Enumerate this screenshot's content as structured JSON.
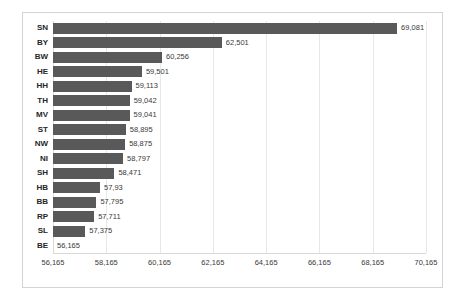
{
  "chart_data": {
    "type": "bar",
    "orientation": "horizontal",
    "title": "",
    "subtitle": "",
    "xlabel": "",
    "ylabel": "",
    "grid": true,
    "legend": false,
    "legend_position": "none",
    "bar_color": "#595959",
    "gridline_color": "#e8e8e8",
    "plot_border_color": "#d4d4d4",
    "xlim": [
      56165,
      70165
    ],
    "xticks": [
      "56,165",
      "58,165",
      "60,165",
      "62,165",
      "64,165",
      "66,165",
      "68,165",
      "70,165"
    ],
    "xtick_values": [
      56165,
      58165,
      60165,
      62165,
      64165,
      66165,
      68165,
      70165
    ],
    "categories": [
      "SN",
      "BY",
      "BW",
      "HE",
      "HH",
      "TH",
      "MV",
      "ST",
      "NW",
      "NI",
      "SH",
      "HB",
      "BB",
      "RP",
      "SL",
      "BE"
    ],
    "values": [
      69081,
      62501,
      60256,
      59501,
      59113,
      59042,
      59041,
      58895,
      58875,
      58797,
      58471,
      57930,
      57795,
      57711,
      57375,
      56165
    ],
    "data_labels": [
      "69,081",
      "62,501",
      "60,256",
      "59,501",
      "59,113",
      "59,042",
      "59,041",
      "58,895",
      "58,875",
      "58,797",
      "58,471",
      "57,93",
      "57,795",
      "57,711",
      "57,375",
      "56,165"
    ],
    "bars": [
      {
        "category": "SN",
        "value": 69081,
        "label": "69,081"
      },
      {
        "category": "BY",
        "value": 62501,
        "label": "62,501"
      },
      {
        "category": "BW",
        "value": 60256,
        "label": "60,256"
      },
      {
        "category": "HE",
        "value": 59501,
        "label": "59,501"
      },
      {
        "category": "HH",
        "value": 59113,
        "label": "59,113"
      },
      {
        "category": "TH",
        "value": 59042,
        "label": "59,042"
      },
      {
        "category": "MV",
        "value": 59041,
        "label": "59,041"
      },
      {
        "category": "ST",
        "value": 58895,
        "label": "58,895"
      },
      {
        "category": "NW",
        "value": 58875,
        "label": "58,875"
      },
      {
        "category": "NI",
        "value": 58797,
        "label": "58,797"
      },
      {
        "category": "SH",
        "value": 58471,
        "label": "58,471"
      },
      {
        "category": "HB",
        "value": 57930,
        "label": "57,93"
      },
      {
        "category": "BB",
        "value": 57795,
        "label": "57,795"
      },
      {
        "category": "RP",
        "value": 57711,
        "label": "57,711"
      },
      {
        "category": "SL",
        "value": 57375,
        "label": "57,375"
      },
      {
        "category": "BE",
        "value": 56165,
        "label": "56,165"
      }
    ]
  }
}
